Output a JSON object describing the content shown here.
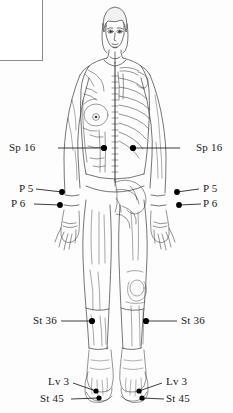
{
  "figure": {
    "view": "anterior",
    "rendering": "line-art-split-surface-and-skeletal",
    "background_color": "#fdfdfd",
    "ink_color": "#2b2b2b",
    "point_marker_color": "#000000"
  },
  "inset": {
    "name": "corner-inset-fragment",
    "description": "cropped anatomical detail fragment, upper-left corner",
    "border_color": "#8a8a8a"
  },
  "labels": {
    "sp16_left": "Sp 16",
    "sp16_right": "Sp 16",
    "p5_left": "P 5",
    "p6_left": "P 6",
    "p5_right": "P 5",
    "p6_right": "P 6",
    "st36_left": "St 36",
    "st36_right": "St 36",
    "lv3_left": "Lv 3",
    "st45_left": "St 45",
    "lv3_right": "Lv 3",
    "st45_right": "St 45"
  },
  "points": [
    {
      "code": "Sp 16",
      "side": "left",
      "x": 104,
      "y": 148
    },
    {
      "code": "Sp 16",
      "side": "right",
      "x": 133,
      "y": 148
    },
    {
      "code": "P 5",
      "side": "left",
      "x": 62,
      "y": 192
    },
    {
      "code": "P 6",
      "side": "left",
      "x": 60,
      "y": 205
    },
    {
      "code": "P 5",
      "side": "right",
      "x": 177,
      "y": 192
    },
    {
      "code": "P 6",
      "side": "right",
      "x": 179,
      "y": 205
    },
    {
      "code": "St 36",
      "side": "left",
      "x": 92,
      "y": 321
    },
    {
      "code": "St 36",
      "side": "right",
      "x": 146,
      "y": 321
    },
    {
      "code": "Lv 3",
      "side": "left",
      "x": 96,
      "y": 391
    },
    {
      "code": "St 45",
      "side": "left",
      "x": 99,
      "y": 398
    },
    {
      "code": "Lv 3",
      "side": "right",
      "x": 139,
      "y": 391
    },
    {
      "code": "St 45",
      "side": "right",
      "x": 142,
      "y": 398
    }
  ]
}
